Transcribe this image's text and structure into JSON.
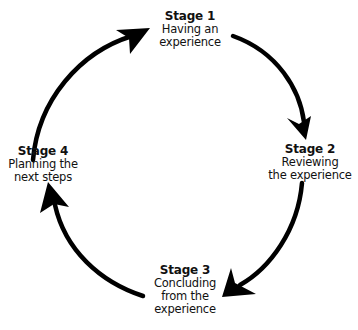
{
  "diagram": {
    "type": "cycle",
    "stroke_color": "#000000",
    "background": "#ffffff",
    "stages": [
      {
        "title": "Stage 1",
        "description": "Having an\nexperience"
      },
      {
        "title": "Stage 2",
        "description": "Reviewing\nthe experience"
      },
      {
        "title": "Stage 3",
        "description": "Concluding\nfrom the\nexperience"
      },
      {
        "title": "Stage 4",
        "description": "Planning the\nnext steps"
      }
    ],
    "arrows": [
      {
        "from": "Stage 4",
        "to": "Stage 1",
        "direction": "clockwise"
      },
      {
        "from": "Stage 1",
        "to": "Stage 2",
        "direction": "clockwise"
      },
      {
        "from": "Stage 2",
        "to": "Stage 3",
        "direction": "clockwise"
      },
      {
        "from": "Stage 3",
        "to": "Stage 4",
        "direction": "clockwise"
      }
    ]
  }
}
